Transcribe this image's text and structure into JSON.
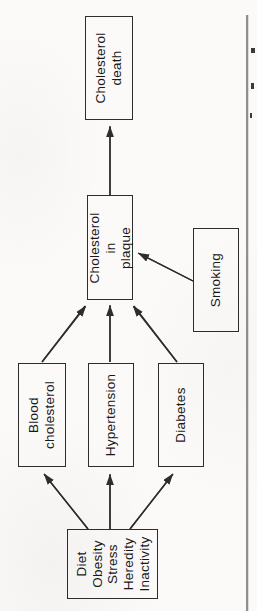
{
  "diagram": {
    "nodes": {
      "risk_factors": {
        "label": "Diet\nObesity\nStress\nHeredity\nInactivity"
      },
      "blood_cholesterol": {
        "label": "Blood\ncholesterol"
      },
      "hypertension": {
        "label": "Hypertension"
      },
      "diabetes": {
        "label": "Diabetes"
      },
      "smoking": {
        "label": "Smoking"
      },
      "cholesterol_in_plaque": {
        "label": "Cholesterol\nin\nplaque"
      },
      "cholesterol_death": {
        "label": "Cholesterol\ndeath"
      }
    },
    "edges": [
      {
        "from": "risk_factors",
        "to": "blood_cholesterol"
      },
      {
        "from": "risk_factors",
        "to": "hypertension"
      },
      {
        "from": "risk_factors",
        "to": "diabetes"
      },
      {
        "from": "blood_cholesterol",
        "to": "cholesterol_in_plaque"
      },
      {
        "from": "hypertension",
        "to": "cholesterol_in_plaque"
      },
      {
        "from": "diabetes",
        "to": "cholesterol_in_plaque"
      },
      {
        "from": "smoking",
        "to": "cholesterol_in_plaque"
      },
      {
        "from": "cholesterol_in_plaque",
        "to": "cholesterol_death"
      }
    ],
    "colors": {
      "line": "#2d2d2d",
      "box_border": "#2d2d2d",
      "text": "#181818",
      "paper": "#fbfaf8",
      "column_rule": "#8f8f8f"
    }
  }
}
